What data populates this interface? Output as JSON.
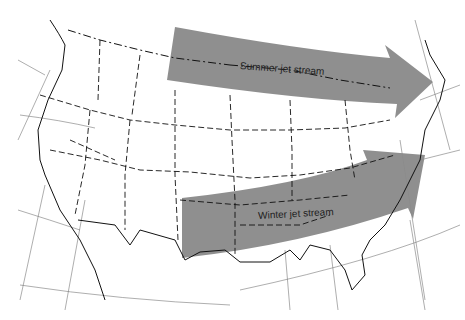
{
  "map": {
    "type": "outline map of the contiguous United States",
    "colors": {
      "background": "#ffffff",
      "arrow_fill": "#8a8a8a",
      "borders": "#111111",
      "graticule": "#666666"
    },
    "arrows": [
      {
        "id": "summer",
        "label": "Summer jet stream"
      },
      {
        "id": "winter",
        "label": "Winter jet stream"
      }
    ]
  }
}
